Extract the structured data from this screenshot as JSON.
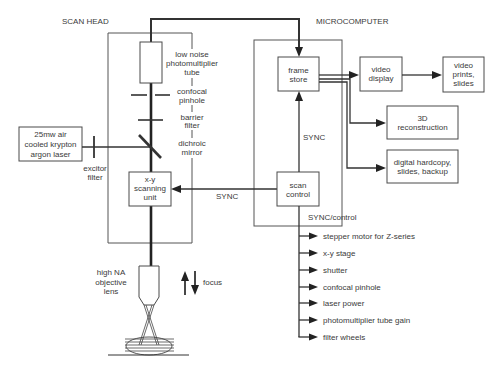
{
  "sections": {
    "scan_head_title": "SCAN HEAD",
    "microcomputer_title": "MICROCOMPUTER"
  },
  "scan_head": {
    "laser": {
      "lines": [
        "25mw air",
        "cooled krypton",
        "argon laser"
      ]
    },
    "excitor_filter": {
      "lines": [
        "excitor",
        "filter"
      ]
    },
    "photomultiplier": {
      "lines": [
        "low noise",
        "photomultiplier",
        "tube"
      ]
    },
    "confocal_pinhole": {
      "lines": [
        "confocal",
        "pinhole"
      ]
    },
    "barrier_filter": {
      "lines": [
        "barrier",
        "filter"
      ]
    },
    "dichroic_mirror": {
      "lines": [
        "dichroic",
        "mirror"
      ]
    },
    "xy_scanning_unit": {
      "lines": [
        "x-y",
        "scanning",
        "unit"
      ]
    },
    "objective": {
      "lines": [
        "high NA",
        "objective",
        "lens"
      ]
    },
    "focus": "focus"
  },
  "microcomputer": {
    "frame_store": {
      "lines": [
        "frame",
        "store"
      ]
    },
    "scan_control": {
      "lines": [
        "scan",
        "control"
      ]
    },
    "video_display": {
      "lines": [
        "video",
        "display"
      ]
    },
    "video_prints": {
      "lines": [
        "video",
        "prints,",
        "slides"
      ]
    },
    "reconstruction": {
      "lines": [
        "3D",
        "reconstruction"
      ]
    },
    "digital_hardcopy": {
      "lines": [
        "digital hardcopy,",
        "slides, backup"
      ]
    }
  },
  "connectors": {
    "sync_to_scanner": "SYNC",
    "sync_to_frame_store": "SYNC",
    "sync_control": "SYNC/control"
  },
  "control_outputs": [
    "stepper motor for Z-series",
    "x-y stage",
    "shutter",
    "confocal pinhole",
    "laser power",
    "photomultiplier tube gain",
    "filter wheels"
  ],
  "colors": {
    "line": "#333333",
    "text": "#3a3a3a",
    "background": "#ffffff"
  }
}
